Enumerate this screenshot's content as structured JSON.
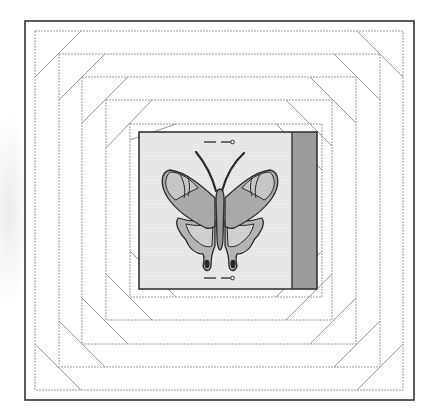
{
  "figure": {
    "type": "quilt-block-diagram",
    "colors": {
      "background": "#ffffff",
      "frame": "#333333",
      "ring_line": "#9a9a9a",
      "panel_fill": "#e4e4e4",
      "panel_border": "#333333",
      "side_strip": "#9c9c9c",
      "wing_light": "#bdbdbd",
      "wing_mid": "#a8a8a8",
      "wing_dark": "#8f8f8f",
      "outline": "#2a2a2a"
    },
    "frame": {
      "x": 25,
      "y": 21,
      "x2": 414,
      "y2": 400
    },
    "rings": [
      {
        "x": 35,
        "y": 31,
        "x2": 403,
        "y2": 390
      },
      {
        "x": 59,
        "y": 54,
        "x2": 380,
        "y2": 367
      },
      {
        "x": 82,
        "y": 77,
        "x2": 356,
        "y2": 344
      },
      {
        "x": 106,
        "y": 100,
        "x2": 332,
        "y2": 320
      },
      {
        "x": 130,
        "y": 124,
        "x2": 322,
        "y2": 297
      }
    ],
    "panel": {
      "x": 139,
      "y": 132,
      "x2": 317,
      "y2": 289
    },
    "side_strip": {
      "x": 292,
      "y": 132,
      "x2": 317,
      "y2": 289
    },
    "markers": [
      {
        "name": "top-grain-arrow",
        "y": 142,
        "x_start": 204,
        "x_end": 234
      },
      {
        "name": "bottom-grain-arrow",
        "y": 278,
        "x_start": 204,
        "x_end": 234
      }
    ],
    "motif": {
      "name": "butterfly",
      "center_x": 220,
      "top_y": 152,
      "bottom_y": 266
    }
  }
}
